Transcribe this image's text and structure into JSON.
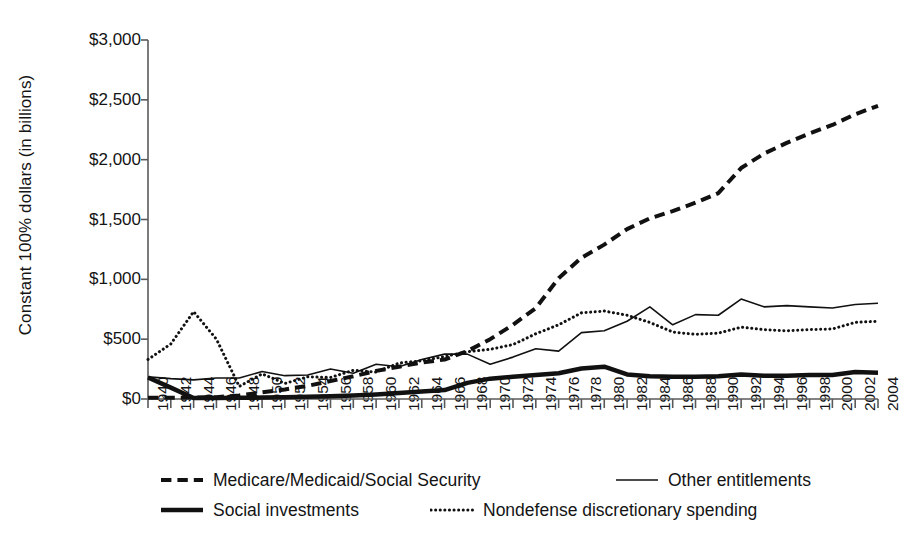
{
  "chart_data": {
    "type": "line",
    "title": "",
    "xlabel": "",
    "ylabel": "Constant 100% dollars (in billions)",
    "xlim": [
      1940,
      2004
    ],
    "ylim": [
      0,
      3000
    ],
    "grid": false,
    "legend_position": "bottom",
    "ytick_labels": [
      "$0",
      "$500",
      "$1,000",
      "$1,500",
      "$2,000",
      "$2,500",
      "$3,000"
    ],
    "ytick_values": [
      0,
      500,
      1000,
      1500,
      2000,
      2500,
      3000
    ],
    "xtick_labels": [
      "1940",
      "1942",
      "1944",
      "1946",
      "1948",
      "1950",
      "1952",
      "1954",
      "1956",
      "1958",
      "1960",
      "1962",
      "1964",
      "1966",
      "1968",
      "1970",
      "1972",
      "1974",
      "1976",
      "1978",
      "1980",
      "1982",
      "1984",
      "1986",
      "1988",
      "1990",
      "1992",
      "1994",
      "1996",
      "1998",
      "2000",
      "2002",
      "2004"
    ],
    "x": [
      1940,
      1942,
      1944,
      1946,
      1948,
      1950,
      1952,
      1954,
      1956,
      1958,
      1960,
      1962,
      1964,
      1966,
      1968,
      1970,
      1972,
      1974,
      1976,
      1978,
      1980,
      1982,
      1984,
      1986,
      1988,
      1990,
      1992,
      1994,
      1996,
      1998,
      2000,
      2002,
      2004
    ],
    "series": [
      {
        "name": "Medicare/Medicaid/Social Security",
        "style": "dashed",
        "color": "#111111",
        "width": 4,
        "values": [
          10,
          10,
          12,
          15,
          30,
          55,
          80,
          110,
          150,
          190,
          235,
          270,
          305,
          330,
          400,
          500,
          620,
          760,
          1010,
          1180,
          1290,
          1420,
          1510,
          1570,
          1640,
          1720,
          1930,
          2050,
          2140,
          2220,
          2290,
          2380,
          2450
        ]
      },
      {
        "name": "Other entitlements",
        "style": "solid-thin",
        "color": "#111111",
        "width": 1.6,
        "values": [
          185,
          170,
          160,
          175,
          175,
          230,
          195,
          200,
          250,
          215,
          290,
          270,
          330,
          375,
          375,
          290,
          350,
          420,
          400,
          555,
          570,
          650,
          770,
          620,
          705,
          700,
          835,
          770,
          780,
          770,
          760,
          790,
          800
        ]
      },
      {
        "name": "Social investments",
        "style": "solid-thick",
        "color": "#111111",
        "width": 4.5,
        "values": [
          180,
          95,
          8,
          8,
          10,
          12,
          15,
          18,
          22,
          30,
          38,
          50,
          62,
          75,
          135,
          170,
          185,
          200,
          215,
          255,
          270,
          205,
          190,
          185,
          185,
          190,
          205,
          195,
          195,
          200,
          200,
          225,
          220
        ]
      },
      {
        "name": "Nondefense discretionary spending",
        "style": "dotted",
        "color": "#111111",
        "width": 3,
        "values": [
          330,
          460,
          730,
          500,
          105,
          210,
          130,
          185,
          180,
          240,
          225,
          300,
          320,
          355,
          395,
          415,
          455,
          545,
          620,
          720,
          735,
          700,
          640,
          560,
          540,
          550,
          600,
          580,
          570,
          580,
          585,
          640,
          650
        ]
      }
    ]
  },
  "legend": {
    "items": [
      {
        "label": "Medicare/Medicaid/Social Security",
        "style": "dashed"
      },
      {
        "label": "Other entitlements",
        "style": "solid-thin"
      },
      {
        "label": "Social investments",
        "style": "solid-thick"
      },
      {
        "label": "Nondefense discretionary spending",
        "style": "dotted"
      }
    ]
  }
}
